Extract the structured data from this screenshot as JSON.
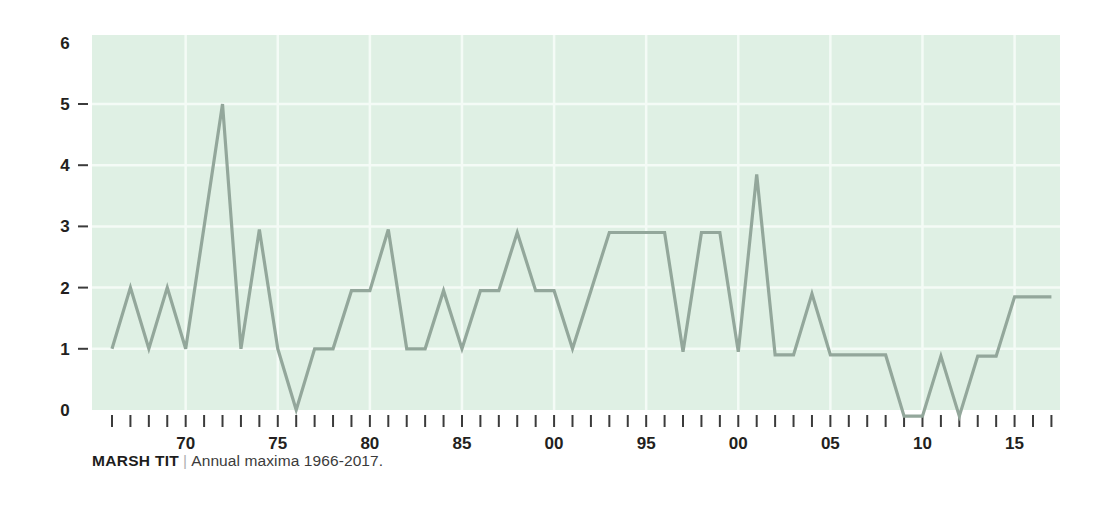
{
  "caption": {
    "species": "MARSH TIT",
    "separator": "|",
    "subtitle": "Annual maxima 1966-2017."
  },
  "colors": {
    "plot_background": "#dff0e4",
    "gridline": "#f4fbf6",
    "line": "#93a79b",
    "tick": "#3b3b3b",
    "text": "#231f20",
    "page_background": "#ffffff"
  },
  "chart_data": {
    "type": "line",
    "title": "MARSH TIT",
    "subtitle": "Annual maxima 1966-2017.",
    "xlabel": "",
    "ylabel": "",
    "xlim": [
      1965.5,
      2017.5
    ],
    "ylim": [
      0,
      6
    ],
    "yticks": [
      0,
      1,
      2,
      3,
      4,
      5,
      6
    ],
    "ytick_labels": [
      "0",
      "1",
      "2",
      "3",
      "4",
      "5",
      "6"
    ],
    "xticks": [
      1966,
      1967,
      1968,
      1969,
      1970,
      1971,
      1972,
      1973,
      1974,
      1975,
      1976,
      1977,
      1978,
      1979,
      1980,
      1981,
      1982,
      1983,
      1984,
      1985,
      1986,
      1987,
      1988,
      1989,
      1990,
      1991,
      1992,
      1993,
      1994,
      1995,
      1996,
      1997,
      1998,
      1999,
      2000,
      2001,
      2002,
      2003,
      2004,
      2005,
      2006,
      2007,
      2008,
      2009,
      2010,
      2011,
      2012,
      2013,
      2014,
      2015,
      2016,
      2017
    ],
    "xtick_labeled": [
      {
        "x": 1970,
        "label": "70"
      },
      {
        "x": 1975,
        "label": "75"
      },
      {
        "x": 1980,
        "label": "80"
      },
      {
        "x": 1985,
        "label": "85"
      },
      {
        "x": 1990,
        "label": "00"
      },
      {
        "x": 1995,
        "label": "95"
      },
      {
        "x": 2000,
        "label": "00"
      },
      {
        "x": 2005,
        "label": "05"
      },
      {
        "x": 2010,
        "label": "10"
      },
      {
        "x": 2015,
        "label": "15"
      }
    ],
    "gridlines_x": [
      1970,
      1975,
      1980,
      1985,
      1990,
      1995,
      2000,
      2005,
      2010,
      2015
    ],
    "gridlines_y": [
      1,
      2,
      3,
      4,
      5
    ],
    "grid": true,
    "legend": false,
    "x": [
      1966,
      1967,
      1968,
      1969,
      1970,
      1971,
      1972,
      1973,
      1974,
      1975,
      1976,
      1977,
      1978,
      1979,
      1980,
      1981,
      1982,
      1983,
      1984,
      1985,
      1986,
      1987,
      1988,
      1989,
      1990,
      1991,
      1992,
      1993,
      1994,
      1995,
      1996,
      1997,
      1998,
      1999,
      2000,
      2001,
      2002,
      2003,
      2004,
      2005,
      2006,
      2007,
      2008,
      2009,
      2010,
      2011,
      2012,
      2013,
      2014,
      2015,
      2016,
      2017
    ],
    "values": [
      1.0,
      2.0,
      1.0,
      2.0,
      1.0,
      3.0,
      5.0,
      1.0,
      2.95,
      1.0,
      0.0,
      1.0,
      1.0,
      1.95,
      1.95,
      2.95,
      1.0,
      1.0,
      1.95,
      1.0,
      1.95,
      1.95,
      2.9,
      1.95,
      1.95,
      1.0,
      1.95,
      2.9,
      2.9,
      2.9,
      2.9,
      0.95,
      2.9,
      2.9,
      0.95,
      3.85,
      0.9,
      0.9,
      1.9,
      0.9,
      0.9,
      0.9,
      0.9,
      -0.1,
      -0.1,
      0.88,
      -0.1,
      0.88,
      0.88,
      1.85,
      1.85,
      1.85
    ],
    "series_name": "Annual maxima"
  },
  "layout": {
    "plot_left": 92,
    "plot_right": 1060,
    "plot_top": 35,
    "plot_bottom": 410,
    "x_first": 112,
    "x_spacing": 18.42,
    "y_zero": 410,
    "y_unit": 61.2
  }
}
